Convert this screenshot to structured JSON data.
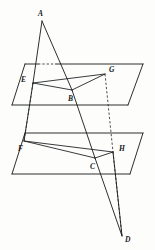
{
  "figure": {
    "background_color": "#fdfdfb",
    "line_color": "#15181c",
    "canvas": {
      "width": 155,
      "height": 250
    }
  },
  "labels": {
    "A": "A",
    "B": "B",
    "C": "C",
    "D": "D",
    "E": "E",
    "F": "F",
    "G": "G",
    "H": "H"
  },
  "points": {
    "A": {
      "x": 42,
      "y": 21
    },
    "B": {
      "x": 72,
      "y": 90
    },
    "C": {
      "x": 95,
      "y": 158
    },
    "D": {
      "x": 122,
      "y": 236
    },
    "E": {
      "x": 33,
      "y": 83
    },
    "F": {
      "x": 24,
      "y": 141
    },
    "G": {
      "x": 105,
      "y": 74
    },
    "H": {
      "x": 113,
      "y": 152
    }
  },
  "label_positions": {
    "A": {
      "x": 38,
      "y": 10
    },
    "B": {
      "x": 68,
      "y": 95
    },
    "C": {
      "x": 90,
      "y": 163
    },
    "D": {
      "x": 125,
      "y": 236
    },
    "E": {
      "x": 21,
      "y": 76
    },
    "F": {
      "x": 18,
      "y": 145
    },
    "G": {
      "x": 109,
      "y": 66
    },
    "H": {
      "x": 119,
      "y": 145
    }
  },
  "planes": {
    "upper": {
      "name": "upper-plane",
      "corners": [
        {
          "x": 25,
          "y": 64
        },
        {
          "x": 143,
          "y": 64
        },
        {
          "x": 128,
          "y": 105
        },
        {
          "x": 12,
          "y": 105
        }
      ]
    },
    "lower": {
      "name": "lower-plane",
      "corners": [
        {
          "x": 25,
          "y": 133
        },
        {
          "x": 143,
          "y": 133
        },
        {
          "x": 130,
          "y": 174
        },
        {
          "x": 12,
          "y": 174
        }
      ]
    }
  },
  "triangles": {
    "upper": {
      "name": "triangle-EBG",
      "vertices": [
        "E",
        "B",
        "G"
      ]
    },
    "lower": {
      "name": "triangle-FCH",
      "vertices": [
        "F",
        "C",
        "H"
      ]
    }
  },
  "rays": [
    {
      "name": "ray-A-E-F",
      "from": "A",
      "through": "E",
      "to": "F"
    },
    {
      "name": "ray-A-B-C-D",
      "from": "A",
      "through": "B",
      "to": "D"
    },
    {
      "name": "ray-G-H-D",
      "from": "G",
      "through": "H",
      "to": "D"
    }
  ],
  "hidden_segments": [
    {
      "name": "hidden-E-F",
      "from": "E",
      "to": "F"
    },
    {
      "name": "hidden-G-H",
      "from": "G",
      "to": "H"
    }
  ]
}
